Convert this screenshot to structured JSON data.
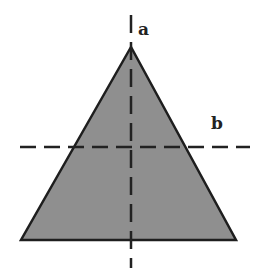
{
  "diagram": {
    "shape": "equilateral-triangle",
    "fill_color": "#8f8f8f",
    "stroke_color": "#1e1e1e",
    "vertices": {
      "apex": [
        131,
        47
      ],
      "base_left": [
        21,
        240
      ],
      "base_right": [
        236,
        240
      ]
    },
    "axes": [
      {
        "id": "a",
        "label": "a",
        "orientation": "vertical",
        "style": "dashed"
      },
      {
        "id": "b",
        "label": "b",
        "orientation": "horizontal",
        "style": "dashed"
      }
    ]
  }
}
